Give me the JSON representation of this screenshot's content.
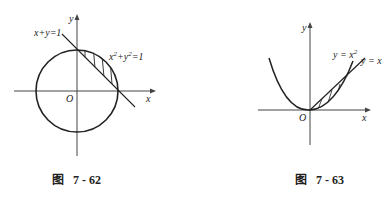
{
  "figures": [
    {
      "id": "7-62",
      "caption_prefix": "图",
      "caption_number": "7 - 62",
      "axis_x": "x",
      "axis_y": "y",
      "origin": "O",
      "line_label": "x+y=1",
      "circle_label_base_x": "x",
      "circle_label_exp": "2",
      "circle_label_mid": "+y",
      "circle_label_end": "=1",
      "shaded_region": "between line x+y=1 and circle x²+y²=1 in first quadrant"
    },
    {
      "id": "7-63",
      "caption_prefix": "图",
      "caption_number": "7 - 63",
      "axis_x": "x",
      "axis_y": "y",
      "origin": "O",
      "parabola_label_base": "y = x",
      "parabola_label_exp": "2",
      "line_label": "y = x",
      "shaded_region": "between y=x and y=x² for 0≤x≤1"
    }
  ],
  "colors": {
    "ink": "#222222",
    "axis": "#444444",
    "background": "#ffffff"
  }
}
